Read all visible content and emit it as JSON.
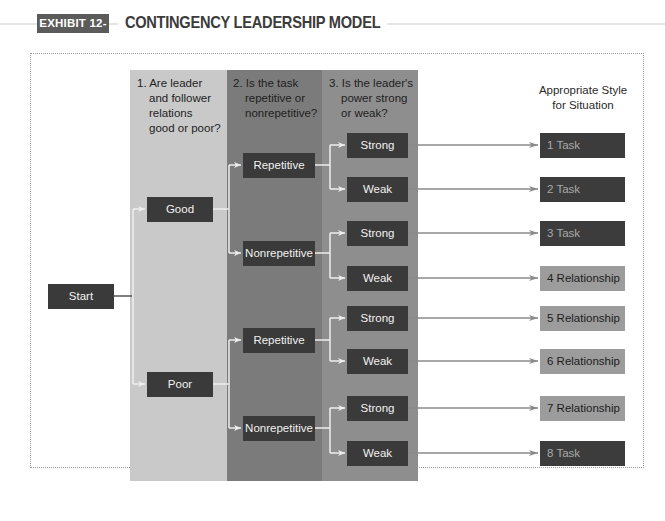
{
  "header": {
    "badge": "EXHIBIT 12-3",
    "title": "CONTINGENCY LEADERSHIP MODEL"
  },
  "columns": [
    {
      "question": [
        "1. Are leader",
        "and follower",
        "relations",
        "good or poor?"
      ],
      "color": "#c9c9c9"
    },
    {
      "question": [
        "2. Is the task",
        "repetitive or",
        "nonrepetitive?"
      ],
      "color": "#7b7b7b"
    },
    {
      "question": [
        "3. Is the leader's",
        "power strong",
        "or weak?"
      ],
      "color": "#8e8e8e"
    }
  ],
  "result_heading": [
    "Appropriate Style",
    "for Situation"
  ],
  "start": "Start",
  "relations": [
    "Good",
    "Poor"
  ],
  "tasks": [
    "Repetitive",
    "Nonrepetitive",
    "Repetitive",
    "Nonrepetitive"
  ],
  "power": [
    "Strong",
    "Weak",
    "Strong",
    "Weak",
    "Strong",
    "Weak",
    "Strong",
    "Weak"
  ],
  "results": [
    {
      "label": "1 Task",
      "style": "task"
    },
    {
      "label": "2 Task",
      "style": "task"
    },
    {
      "label": "3 Task",
      "style": "task"
    },
    {
      "label": "4 Relationship",
      "style": "relationship"
    },
    {
      "label": "5 Relationship",
      "style": "relationship"
    },
    {
      "label": "6 Relationship",
      "style": "relationship"
    },
    {
      "label": "7 Relationship",
      "style": "relationship"
    },
    {
      "label": "8 Task",
      "style": "task"
    }
  ],
  "colors": {
    "box_dark": "#3a3a3a",
    "task_box": "#3c3c3c",
    "relationship_box": "#9c9c9c",
    "connector_light": "#e8e8e8",
    "arrow_gray": "#8a8a8a"
  }
}
